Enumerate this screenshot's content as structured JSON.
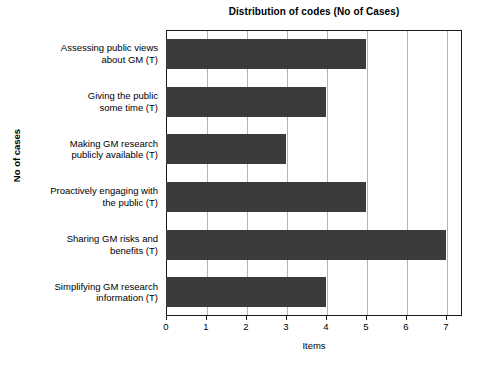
{
  "chart_data": {
    "type": "bar",
    "orientation": "horizontal",
    "title": "Distribution of codes (No of Cases)",
    "xlabel": "Items",
    "ylabel": "No of cases",
    "categories": [
      "Assessing public views about GM (T)",
      "Giving the public some time (T)",
      "Making GM research publicly available (T)",
      "Proactively engaging with the public (T)",
      "Sharing GM risks and benefits (T)",
      "Simplifying GM research information (T)"
    ],
    "category_lines": [
      [
        "Assessing public views",
        "about GM (T)"
      ],
      [
        "Giving the public",
        "some time (T)"
      ],
      [
        "Making GM research",
        "publicly available (T)"
      ],
      [
        "Proactively engaging with",
        "the public (T)"
      ],
      [
        "Sharing GM risks and",
        "benefits (T)"
      ],
      [
        "Simplifying GM research",
        "information (T)"
      ]
    ],
    "values": [
      5,
      4,
      3,
      5,
      7,
      4
    ],
    "xticks": [
      0,
      1,
      2,
      3,
      4,
      5,
      6,
      7
    ],
    "xticklabels": [
      "0",
      "1",
      "2",
      "3",
      "4",
      "5",
      "6",
      "7"
    ],
    "xlim": [
      0,
      7.4
    ],
    "grid": true,
    "grid_axis": "x",
    "legend": false,
    "bar_color": "#3b3b3b",
    "grid_color": "#b4b4b4",
    "frame_color": "#1a1a1a",
    "background": "#ffffff"
  }
}
